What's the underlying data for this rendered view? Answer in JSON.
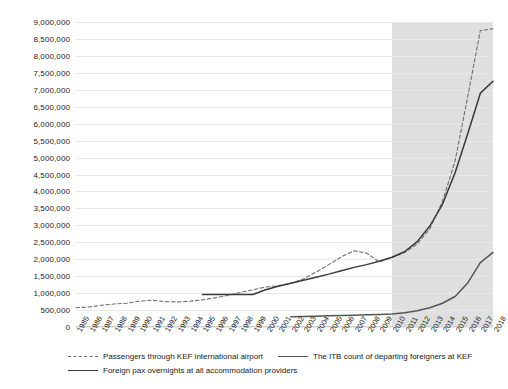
{
  "chart_data": {
    "type": "line",
    "title": "",
    "xlabel": "",
    "ylabel": "",
    "ylim": [
      0,
      9000000
    ],
    "grid": true,
    "legend_position": "bottom",
    "y_ticks": [
      "0",
      "500,000",
      "1,000,000",
      "1,500,000",
      "2,000,000",
      "2,500,000",
      "3,000,000",
      "3,500,000",
      "4,000,000",
      "4,500,000",
      "5,000,000",
      "5,500,000",
      "6,000,000",
      "6,500,000",
      "7,000,000",
      "7,500,000",
      "8,000,000",
      "8,500,000",
      "9,000,000"
    ],
    "y_tick_values": [
      0,
      500000,
      1000000,
      1500000,
      2000000,
      2500000,
      3000000,
      3500000,
      4000000,
      4500000,
      5000000,
      5500000,
      6000000,
      6500000,
      7000000,
      7500000,
      8000000,
      8500000,
      9000000
    ],
    "categories": [
      "1985",
      "1986",
      "1987",
      "1988",
      "1989",
      "1990",
      "1991",
      "1992",
      "1993",
      "1994",
      "1995",
      "1996",
      "1997",
      "1998",
      "1999",
      "2000",
      "2001",
      "2002",
      "2003",
      "2004",
      "2005",
      "2006",
      "2007",
      "2008",
      "2009",
      "2010",
      "2011",
      "2012",
      "2013",
      "2014",
      "2015",
      "2016",
      "2017",
      "2018"
    ],
    "shaded_region": {
      "from": "2010",
      "to": "2018",
      "color": "#d9d9d9"
    },
    "series": [
      {
        "name": "Passengers through KEF international airport",
        "style": "dashed",
        "color": "#6f6f6f",
        "values": [
          570000,
          590000,
          640000,
          680000,
          700000,
          760000,
          790000,
          750000,
          740000,
          760000,
          800000,
          860000,
          930000,
          1020000,
          1100000,
          1180000,
          1220000,
          1290000,
          1420000,
          1620000,
          1840000,
          2070000,
          2250000,
          2180000,
          1920000,
          2050000,
          2200000,
          2450000,
          2900000,
          3700000,
          4900000,
          6800000,
          8750000,
          8800000
        ]
      },
      {
        "name": "The ITB count of departing foreigners at KEF",
        "style": "solid",
        "color": "#555555",
        "values": [
          null,
          null,
          null,
          null,
          null,
          null,
          null,
          null,
          null,
          null,
          null,
          null,
          null,
          null,
          null,
          null,
          null,
          300000,
          310000,
          320000,
          330000,
          340000,
          350000,
          360000,
          370000,
          380000,
          420000,
          480000,
          570000,
          700000,
          900000,
          1300000,
          1900000,
          2200000
        ]
      },
      {
        "name": "Foreign pax overnights at all accommodation providers",
        "style": "solid",
        "color": "#3a3a3a",
        "values": [
          null,
          null,
          null,
          null,
          null,
          null,
          null,
          null,
          null,
          null,
          960000,
          960000,
          960000,
          960000,
          960000,
          1100000,
          1200000,
          1290000,
          1380000,
          1470000,
          1560000,
          1660000,
          1760000,
          1840000,
          1940000,
          2060000,
          2220000,
          2520000,
          2980000,
          3620000,
          4550000,
          5700000,
          6900000,
          7250000
        ]
      }
    ]
  },
  "legend": {
    "items": [
      {
        "label": "Passengers through KEF international airport",
        "swatch": "dashed-line-swatch"
      },
      {
        "label": "The ITB count of departing foreigners at KEF",
        "swatch": "solid-line-swatch"
      },
      {
        "label": "Foreign pax overnights at all accommodation providers",
        "swatch": "solid-line-swatch"
      }
    ]
  }
}
